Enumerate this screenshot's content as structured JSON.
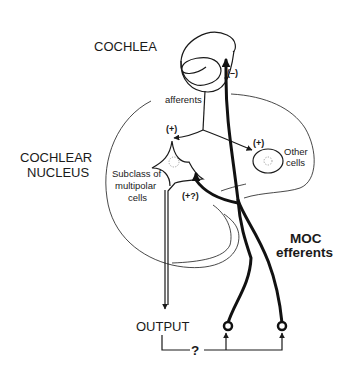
{
  "figure": {
    "labels": {
      "cochlea": "COCHLEA",
      "cochlear_nucleus_line1": "COCHLEAR",
      "cochlear_nucleus_line2": "NUCLEUS",
      "afferents": "afferents",
      "subclass_line1": "Subclass of",
      "subclass_line2": "multipolar",
      "subclass_line3": "cells",
      "other_line1": "Other",
      "other_line2": "cells",
      "moc_line1": "MOC",
      "moc_line2": "efferents",
      "output": "OUTPUT",
      "question": "?"
    },
    "signs": {
      "cochlea_inhibition": "(–)",
      "multipolar_excitation": "(+)",
      "other_excitation": "(+)",
      "moc_collateral": "(+?)"
    },
    "colors": {
      "ink": "#1a1a1a",
      "background": "#ffffff"
    }
  }
}
